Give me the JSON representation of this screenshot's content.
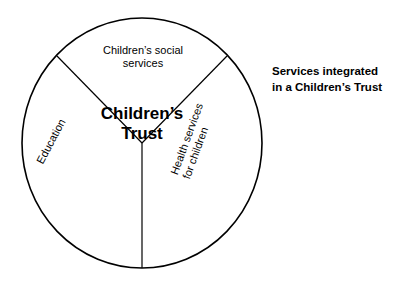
{
  "diagram": {
    "center": {
      "line1": "Children’s",
      "line2": "Trust"
    },
    "segments": [
      {
        "id": "social-services",
        "line1": "Children’s social",
        "line2": "services"
      },
      {
        "id": "education",
        "line1": "Education",
        "line2": ""
      },
      {
        "id": "health-services",
        "line1": "Health services",
        "line2": "for children"
      }
    ],
    "caption": {
      "line1": "Services integrated",
      "line2": "in a Children’s Trust"
    },
    "colors": {
      "stroke": "#000000",
      "text": "#000000",
      "background": "#ffffff"
    }
  }
}
